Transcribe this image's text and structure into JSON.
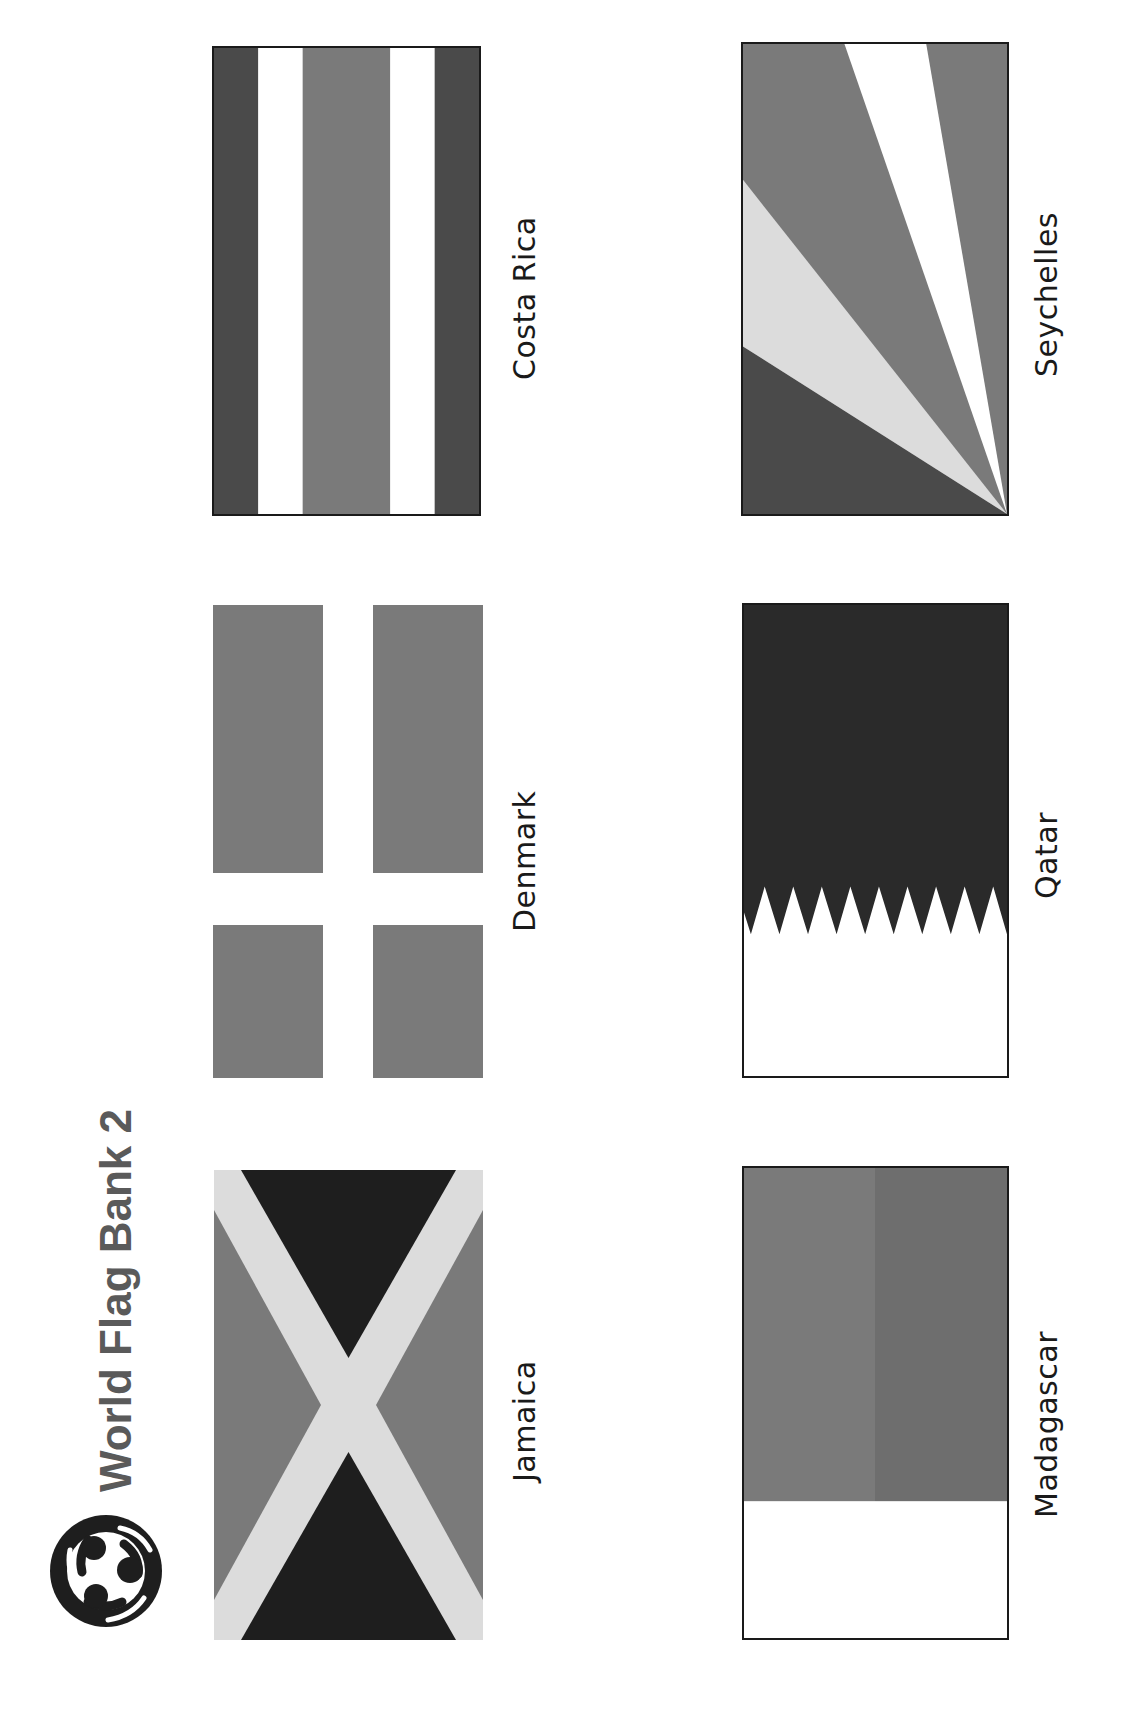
{
  "header": {
    "title": "World Flag Bank 2",
    "logo_icon": "three-people-circle-logo-icon"
  },
  "colors": {
    "black": "#1e1e1e",
    "dark_gray": "#4a4a4a",
    "mid_gray": "#7a7a7a",
    "mid_gray_2": "#6e6e6e",
    "light_gray": "#dcdcdc",
    "white": "#ffffff",
    "title_gray": "#5a5a5a"
  },
  "flags": [
    {
      "id": "costa-rica",
      "name": "Costa Rica",
      "layout": "vertical stripes: dark, white, mid (double width), white, dark"
    },
    {
      "id": "denmark",
      "name": "Denmark",
      "layout": "gray field with white cross"
    },
    {
      "id": "jamaica",
      "name": "Jamaica",
      "layout": "light diagonal saltire, black hoist/fly triangles, gray side triangles"
    },
    {
      "id": "seychelles",
      "name": "Seychelles",
      "layout": "five oblique bands radiating from corner"
    },
    {
      "id": "qatar",
      "name": "Qatar",
      "layout": "dark field with white serrated band, 9 points"
    },
    {
      "id": "madagascar",
      "name": "Madagascar",
      "layout": "white band with two gray blocks"
    }
  ]
}
